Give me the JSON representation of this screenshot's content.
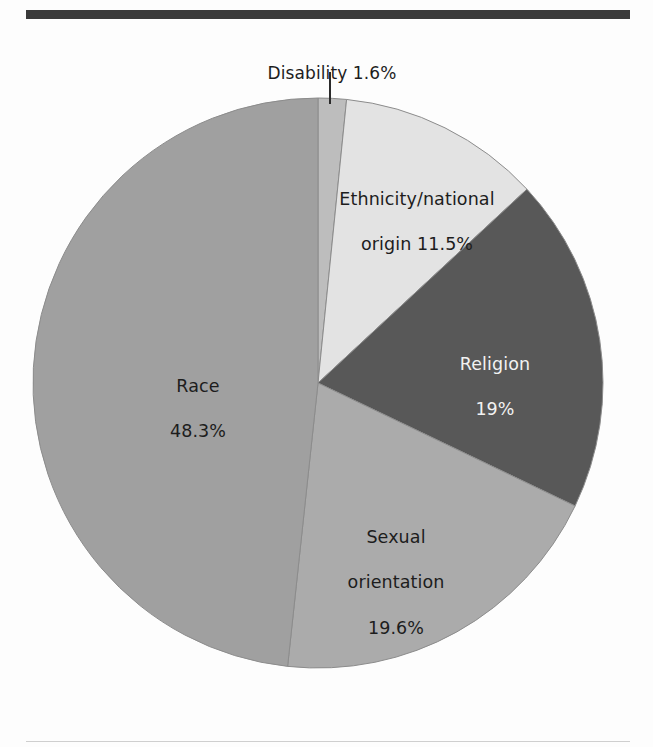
{
  "chart_data": {
    "type": "pie",
    "title": "",
    "subtitle": "",
    "xlabel": "",
    "ylabel": "",
    "legend_position": "none",
    "grid": false,
    "labels_inside": true,
    "start_angle_deg": 0,
    "direction": "clockwise",
    "categories": [
      "Disability",
      "Ethnicity/national origin",
      "Religion",
      "Sexual orientation",
      "Race"
    ],
    "values": [
      1.6,
      11.5,
      19,
      19.6,
      48.3
    ],
    "value_suffix": "%",
    "slices": [
      {
        "name": "Disability",
        "value": 1.6,
        "value_text": "1.6%",
        "label_text": "Disability 1.6%",
        "label_lines": [
          "Disability 1.6%"
        ],
        "color": "#bdbdbd",
        "label_placement": "outside-leader-line",
        "label_color": "#1d1d1d"
      },
      {
        "name": "Ethnicity/national origin",
        "value": 11.5,
        "value_text": "11.5%",
        "label_text": "Ethnicity/national origin 11.5%",
        "label_lines": [
          "Ethnicity/national",
          "origin 11.5%"
        ],
        "color": "#e3e3e3",
        "label_placement": "inside",
        "label_color": "#1d1d1d"
      },
      {
        "name": "Religion",
        "value": 19,
        "value_text": "19%",
        "label_text": "Religion 19%",
        "label_lines": [
          "Religion",
          "19%"
        ],
        "color": "#585858",
        "label_placement": "inside",
        "label_color": "#f2f2f2"
      },
      {
        "name": "Sexual orientation",
        "value": 19.6,
        "value_text": "19.6%",
        "label_text": "Sexual orientation 19.6%",
        "label_lines": [
          "Sexual",
          "orientation",
          "19.6%"
        ],
        "color": "#ababab",
        "label_placement": "inside",
        "label_color": "#1d1d1d"
      },
      {
        "name": "Race",
        "value": 48.3,
        "value_text": "48.3%",
        "label_text": "Race 48.3%",
        "label_lines": [
          "Race",
          "48.3%"
        ],
        "color": "#a0a0a0",
        "label_placement": "inside",
        "label_color": "#1d1d1d"
      }
    ]
  },
  "labels": {
    "disability": "Disability 1.6%",
    "ethnicity_line1": "Ethnicity/national",
    "ethnicity_line2": "origin 11.5%",
    "religion_line1": "Religion",
    "religion_line2": "19%",
    "sexual_line1": "Sexual",
    "sexual_line2": "orientation",
    "sexual_line3": "19.6%",
    "race_line1": "Race",
    "race_line2": "48.3%"
  },
  "colors": {
    "background": "#fdfdfd",
    "top_rule": "#3a3a3a",
    "bottom_rule": "#cfcfcf",
    "slice_disability": "#bdbdbd",
    "slice_ethnicity": "#e3e3e3",
    "slice_religion": "#585858",
    "slice_sexual": "#ababab",
    "slice_race": "#a0a0a0",
    "leader_line": "#2b2b2b",
    "slice_edge": "#8c8c8c"
  },
  "geometry": {
    "center_x": 318,
    "center_y": 383,
    "radius": 285
  }
}
